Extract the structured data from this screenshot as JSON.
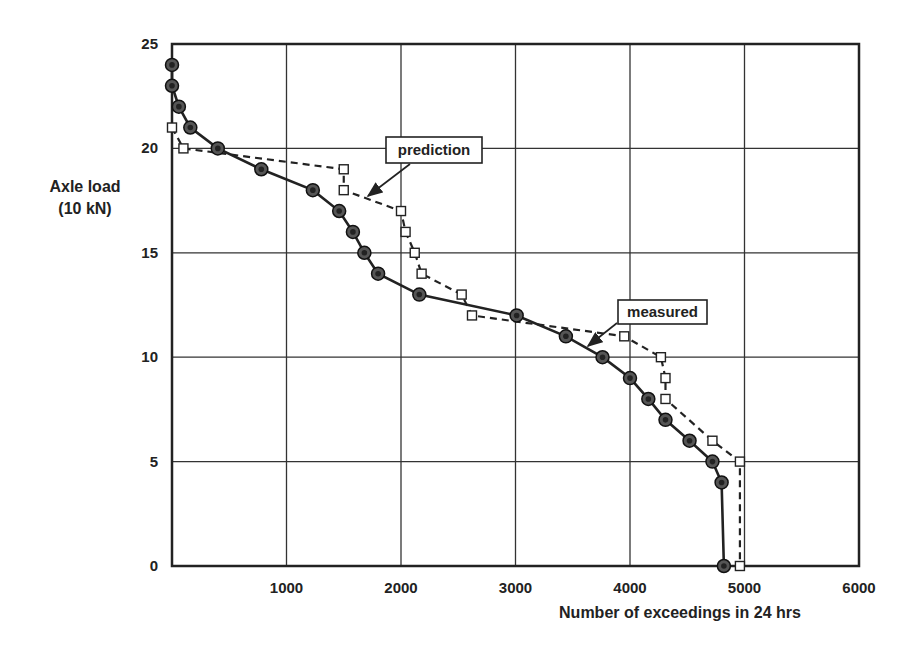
{
  "chart_data": {
    "type": "line",
    "title": "",
    "xlabel": "Number of exceedings in 24 hrs",
    "ylabel": "Axle load (10 kN)",
    "ylabel_lines": [
      "Axle load",
      "(10 kN)"
    ],
    "xlim": [
      0,
      6000
    ],
    "ylim": [
      0,
      25
    ],
    "x_ticks": [
      1000,
      2000,
      3000,
      4000,
      5000,
      6000
    ],
    "x_tick_labels": [
      "1000",
      "2000",
      "3000",
      "4000",
      "5000",
      "6000"
    ],
    "y_ticks": [
      0,
      5,
      10,
      15,
      20,
      25
    ],
    "y_tick_labels": [
      "0",
      "5",
      "10",
      "15",
      "20",
      "25"
    ],
    "grid": true,
    "legend_position": "inline annotations",
    "series": [
      {
        "name": "measured",
        "style": "solid line, filled circle markers",
        "color": "#222222",
        "points": [
          {
            "x": 0,
            "y": 24
          },
          {
            "x": 0,
            "y": 23
          },
          {
            "x": 60,
            "y": 22
          },
          {
            "x": 160,
            "y": 21
          },
          {
            "x": 400,
            "y": 20
          },
          {
            "x": 780,
            "y": 19
          },
          {
            "x": 1230,
            "y": 18
          },
          {
            "x": 1460,
            "y": 17
          },
          {
            "x": 1580,
            "y": 16
          },
          {
            "x": 1680,
            "y": 15
          },
          {
            "x": 1800,
            "y": 14
          },
          {
            "x": 2160,
            "y": 13
          },
          {
            "x": 3010,
            "y": 12
          },
          {
            "x": 3440,
            "y": 11
          },
          {
            "x": 3760,
            "y": 10
          },
          {
            "x": 4000,
            "y": 9
          },
          {
            "x": 4160,
            "y": 8
          },
          {
            "x": 4310,
            "y": 7
          },
          {
            "x": 4520,
            "y": 6
          },
          {
            "x": 4720,
            "y": 5
          },
          {
            "x": 4800,
            "y": 4
          },
          {
            "x": 4820,
            "y": 0
          }
        ]
      },
      {
        "name": "prediction",
        "style": "dashed line, open square markers",
        "color": "#222222",
        "points": [
          {
            "x": 0,
            "y": 21
          },
          {
            "x": 100,
            "y": 20
          },
          {
            "x": 1500,
            "y": 19
          },
          {
            "x": 1500,
            "y": 18
          },
          {
            "x": 2000,
            "y": 17
          },
          {
            "x": 2040,
            "y": 16
          },
          {
            "x": 2120,
            "y": 15
          },
          {
            "x": 2180,
            "y": 14
          },
          {
            "x": 2530,
            "y": 13
          },
          {
            "x": 2620,
            "y": 12
          },
          {
            "x": 3950,
            "y": 11
          },
          {
            "x": 4270,
            "y": 10
          },
          {
            "x": 4310,
            "y": 9
          },
          {
            "x": 4310,
            "y": 8
          },
          {
            "x": 4720,
            "y": 6
          },
          {
            "x": 4960,
            "y": 5
          },
          {
            "x": 4960,
            "y": 0
          }
        ]
      }
    ],
    "annotations": [
      {
        "text": "prediction",
        "box": {
          "x": 386,
          "y": 137,
          "w": 96,
          "h": 26
        },
        "arrow_from": [
          410,
          164
        ],
        "arrow_to": [
          368,
          196
        ]
      },
      {
        "text": "measured",
        "box": {
          "x": 618,
          "y": 300,
          "w": 89,
          "h": 24
        },
        "arrow_from": [
          617,
          323
        ],
        "arrow_to": [
          588,
          346
        ]
      }
    ]
  },
  "caption": {
    "text": ""
  }
}
